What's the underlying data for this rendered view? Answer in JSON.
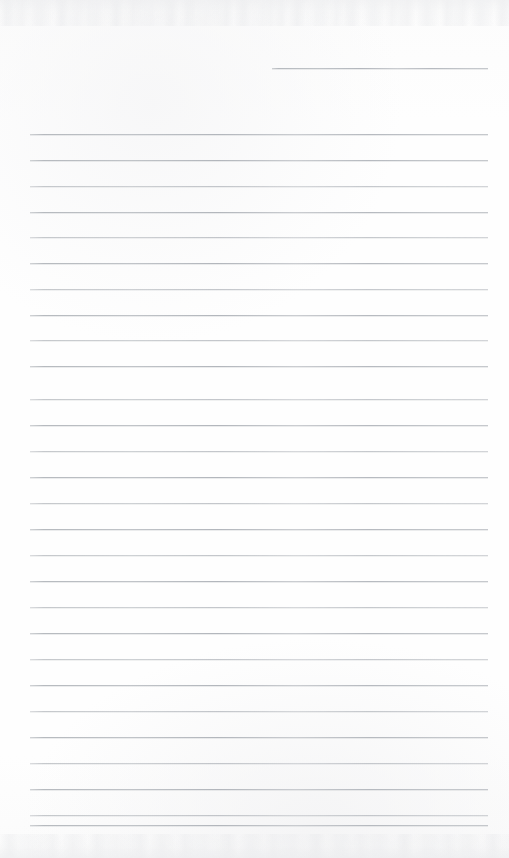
{
  "page": {
    "kind": "scanned-lined-notebook-page",
    "width": 509,
    "height": 858,
    "background_color": "#fdfdfd",
    "rule_color": "#b2b6bc",
    "rule_halo_color": "#c4c7cc",
    "edge_noise_color": "#e5e6e9",
    "visible_text": "",
    "text_content_note": "",
    "line_count_total": 29,
    "line_count_full_width": 28,
    "line_count_partial": 1,
    "left_margin_x": 30,
    "right_margin_x": 488,
    "line_spacing_px": 25.7,
    "has_vertical_margin_rule": false
  },
  "rules": [
    {
      "id": "rule-partial-header",
      "y": 68,
      "x1": 272,
      "x2": 488,
      "weight": "strong",
      "partial": true
    },
    {
      "id": "rule-01",
      "y": 134,
      "x1": 30,
      "x2": 488,
      "weight": "strong",
      "partial": false
    },
    {
      "id": "rule-02",
      "y": 160,
      "x1": 30,
      "x2": 488,
      "weight": "strong",
      "partial": false
    },
    {
      "id": "rule-03",
      "y": 186,
      "x1": 30,
      "x2": 488,
      "weight": "faint",
      "partial": false
    },
    {
      "id": "rule-04",
      "y": 212,
      "x1": 30,
      "x2": 488,
      "weight": "strong",
      "partial": false
    },
    {
      "id": "rule-05",
      "y": 237,
      "x1": 30,
      "x2": 488,
      "weight": "faint",
      "partial": false
    },
    {
      "id": "rule-06",
      "y": 263,
      "x1": 30,
      "x2": 488,
      "weight": "strong",
      "partial": false
    },
    {
      "id": "rule-07",
      "y": 289,
      "x1": 30,
      "x2": 488,
      "weight": "faint",
      "partial": false
    },
    {
      "id": "rule-08",
      "y": 315,
      "x1": 30,
      "x2": 488,
      "weight": "strong",
      "partial": false
    },
    {
      "id": "rule-09",
      "y": 340,
      "x1": 30,
      "x2": 488,
      "weight": "faint",
      "partial": false
    },
    {
      "id": "rule-10",
      "y": 366,
      "x1": 30,
      "x2": 488,
      "weight": "strong",
      "partial": false
    },
    {
      "id": "rule-11",
      "y": 399,
      "x1": 30,
      "x2": 488,
      "weight": "faint",
      "partial": false
    },
    {
      "id": "rule-12",
      "y": 425,
      "x1": 30,
      "x2": 488,
      "weight": "strong",
      "partial": false
    },
    {
      "id": "rule-13",
      "y": 451,
      "x1": 30,
      "x2": 488,
      "weight": "faint",
      "partial": false
    },
    {
      "id": "rule-14",
      "y": 477,
      "x1": 30,
      "x2": 488,
      "weight": "strong",
      "partial": false
    },
    {
      "id": "rule-15",
      "y": 503,
      "x1": 30,
      "x2": 488,
      "weight": "faint",
      "partial": false
    },
    {
      "id": "rule-16",
      "y": 529,
      "x1": 30,
      "x2": 488,
      "weight": "strong",
      "partial": false
    },
    {
      "id": "rule-17",
      "y": 555,
      "x1": 30,
      "x2": 488,
      "weight": "faint",
      "partial": false
    },
    {
      "id": "rule-18",
      "y": 581,
      "x1": 30,
      "x2": 488,
      "weight": "strong",
      "partial": false
    },
    {
      "id": "rule-19",
      "y": 607,
      "x1": 30,
      "x2": 488,
      "weight": "faint",
      "partial": false
    },
    {
      "id": "rule-20",
      "y": 633,
      "x1": 30,
      "x2": 488,
      "weight": "strong",
      "partial": false
    },
    {
      "id": "rule-21",
      "y": 659,
      "x1": 30,
      "x2": 488,
      "weight": "faint",
      "partial": false
    },
    {
      "id": "rule-22",
      "y": 685,
      "x1": 30,
      "x2": 488,
      "weight": "strong",
      "partial": false
    },
    {
      "id": "rule-23",
      "y": 711,
      "x1": 30,
      "x2": 488,
      "weight": "faint",
      "partial": false
    },
    {
      "id": "rule-24",
      "y": 737,
      "x1": 30,
      "x2": 488,
      "weight": "strong",
      "partial": false
    },
    {
      "id": "rule-25",
      "y": 763,
      "x1": 30,
      "x2": 488,
      "weight": "faint",
      "partial": false
    },
    {
      "id": "rule-26",
      "y": 789,
      "x1": 30,
      "x2": 488,
      "weight": "strong",
      "partial": false
    },
    {
      "id": "rule-27",
      "y": 815,
      "x1": 30,
      "x2": 488,
      "weight": "faint",
      "partial": false
    },
    {
      "id": "rule-28",
      "y": 825,
      "x1": 30,
      "x2": 488,
      "weight": "strong",
      "partial": false
    }
  ]
}
